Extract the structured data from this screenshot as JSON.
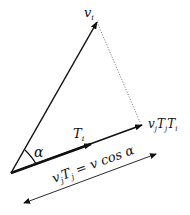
{
  "diagram": {
    "labels": {
      "v_i": "v",
      "v_i_sub": "i",
      "alpha": "α",
      "T_i": "T",
      "T_i_sub": "i",
      "proj_label": "vjTjTi",
      "proj_v": "v",
      "proj_j1": "j",
      "proj_T": "T",
      "proj_j2": "j",
      "proj_T2": "T",
      "proj_i": "i",
      "eq_v": "v",
      "eq_j1": "j",
      "eq_T": "T",
      "eq_j2": "j",
      "eq_rest": " = v cos α"
    },
    "colors": {
      "line": "#111111",
      "dotted": "#666666"
    }
  }
}
